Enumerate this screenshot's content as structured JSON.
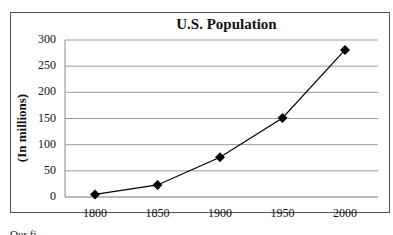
{
  "chart_data": {
    "type": "line",
    "title": "U.S. Population",
    "xlabel": "",
    "ylabel": "(In millions)",
    "categories": [
      "1800",
      "1850",
      "1900",
      "1950",
      "2000"
    ],
    "x": [
      1800,
      1850,
      1900,
      1950,
      2000
    ],
    "series": [
      {
        "name": "U.S. Population",
        "values": [
          5,
          23,
          76,
          151,
          281
        ],
        "marker": "diamond",
        "color": "#000000"
      }
    ],
    "yticks": [
      "0",
      "50",
      "100",
      "150",
      "200",
      "250",
      "300"
    ],
    "ylim": [
      0,
      300
    ],
    "grid": true,
    "legend": "none"
  },
  "labels": {
    "title": "U.S. Population",
    "ylabel": "(In millions)",
    "footer_fragment": "Our  fi"
  }
}
